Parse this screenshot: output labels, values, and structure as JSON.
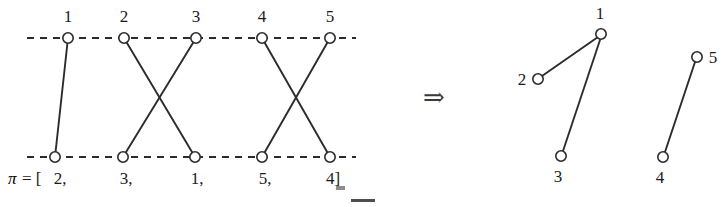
{
  "figure": {
    "left_panel": {
      "name": "permutation-two-row-diagram",
      "top_labels": [
        "1",
        "2",
        "3",
        "4",
        "5"
      ],
      "bottom_labels": [
        "2,",
        "3,",
        "1,",
        "5,",
        "4]"
      ],
      "permutation_prefix_pi": "π",
      "permutation_prefix_eq": "= [",
      "permutation_values": [
        2,
        3,
        1,
        5,
        4
      ],
      "permutation_full_text": "π = [2, 3, 1, 5, 4]",
      "top_nodes": [
        {
          "id": 1,
          "label": "1",
          "x": 68,
          "y": 38
        },
        {
          "id": 2,
          "label": "2",
          "x": 124,
          "y": 38
        },
        {
          "id": 3,
          "label": "3",
          "x": 196,
          "y": 38
        },
        {
          "id": 4,
          "label": "4",
          "x": 262,
          "y": 38
        },
        {
          "id": 5,
          "label": "5",
          "x": 330,
          "y": 38
        }
      ],
      "bottom_nodes": [
        {
          "id": 1,
          "label": "2,",
          "x": 55,
          "y": 157
        },
        {
          "id": 2,
          "label": "3,",
          "x": 123,
          "y": 157
        },
        {
          "id": 3,
          "label": "1,",
          "x": 195,
          "y": 157
        },
        {
          "id": 4,
          "label": "5,",
          "x": 262,
          "y": 157
        },
        {
          "id": 5,
          "label": "4]",
          "x": 330,
          "y": 157
        }
      ],
      "edges": [
        {
          "from_top": 1,
          "to_bottom": 1,
          "x1": 68,
          "y1": 38,
          "x2": 55,
          "y2": 157
        },
        {
          "from_top": 2,
          "to_bottom": 3,
          "x1": 124,
          "y1": 38,
          "x2": 195,
          "y2": 157
        },
        {
          "from_top": 3,
          "to_bottom": 2,
          "x1": 196,
          "y1": 38,
          "x2": 123,
          "y2": 157
        },
        {
          "from_top": 4,
          "to_bottom": 5,
          "x1": 262,
          "y1": 38,
          "x2": 330,
          "y2": 157
        },
        {
          "from_top": 5,
          "to_bottom": 4,
          "x1": 330,
          "y1": 38,
          "x2": 262,
          "y2": 157
        }
      ],
      "guide_lines": [
        {
          "name": "top-dashed-axis",
          "x1": 27,
          "y1": 38,
          "x2": 356,
          "y2": 38
        },
        {
          "name": "bottom-dashed-axis",
          "x1": 27,
          "y1": 157,
          "x2": 356,
          "y2": 157
        }
      ]
    },
    "implies_symbol": {
      "name": "implies-arrow",
      "glyph": "⇒",
      "x": 434,
      "y": 105
    },
    "right_panel": {
      "name": "cycle-graph-diagram",
      "nodes": [
        {
          "id": 1,
          "label": "1",
          "x": 601,
          "y": 34,
          "label_x": 600,
          "label_y": 19
        },
        {
          "id": 2,
          "label": "2",
          "x": 538,
          "y": 79,
          "label_x": 522,
          "label_y": 85
        },
        {
          "id": 3,
          "label": "3",
          "x": 561,
          "y": 156,
          "label_x": 558,
          "label_y": 182
        },
        {
          "id": 4,
          "label": "4",
          "x": 663,
          "y": 157,
          "label_x": 660,
          "label_y": 183
        },
        {
          "id": 5,
          "label": "5",
          "x": 697,
          "y": 57,
          "label_x": 713,
          "label_y": 63
        }
      ],
      "edges": [
        {
          "from": 2,
          "to": 1,
          "x1": 538,
          "y1": 79,
          "x2": 601,
          "y2": 34
        },
        {
          "from": 1,
          "to": 3,
          "x1": 601,
          "y1": 34,
          "x2": 561,
          "y2": 156
        },
        {
          "from": 4,
          "to": 5,
          "x1": 663,
          "y1": 157,
          "x2": 697,
          "y2": 57
        }
      ],
      "components": [
        {
          "name": "component-123",
          "members": [
            1,
            2,
            3
          ]
        },
        {
          "name": "component-45",
          "members": [
            4,
            5
          ]
        }
      ]
    },
    "colors": {
      "ink": "#2b2b2b",
      "text": "#1a1a1a",
      "background": "#ffffff",
      "arrow": "#3a3a3a"
    }
  }
}
